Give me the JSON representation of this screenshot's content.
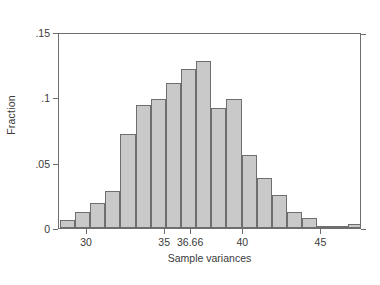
{
  "chart_data": {
    "type": "bar",
    "title": "",
    "subtitle": "",
    "xlabel": "Sample variances",
    "ylabel": "Fraction",
    "xlim": [
      28.2,
      47.6
    ],
    "ylim": [
      0,
      0.15
    ],
    "grid": false,
    "legend": null,
    "xticks": [
      30,
      35,
      36.66,
      40,
      45
    ],
    "xtick_labels": [
      "30",
      "35",
      "36.66",
      "40",
      "45"
    ],
    "yticks": [
      0,
      0.05,
      0.1,
      0.15
    ],
    "ytick_labels": [
      "0",
      ".05",
      ".1",
      ".15"
    ],
    "bin_width": 0.97,
    "bin_starts": [
      28.25,
      29.22,
      30.19,
      31.16,
      32.13,
      33.1,
      34.07,
      35.04,
      36.01,
      36.98,
      37.95,
      38.92,
      39.89,
      40.86,
      41.83,
      42.8,
      43.77,
      44.74,
      45.71,
      46.68
    ],
    "categories": [
      "28.7",
      "29.7",
      "30.7",
      "31.6",
      "32.6",
      "33.6",
      "34.6",
      "35.5",
      "36.5",
      "37.5",
      "38.4",
      "39.4",
      "40.4",
      "41.3",
      "42.3",
      "43.3",
      "44.2",
      "45.2",
      "46.2",
      "47.2"
    ],
    "values": [
      0.006,
      0.012,
      0.019,
      0.028,
      0.072,
      0.094,
      0.099,
      0.111,
      0.122,
      0.128,
      0.092,
      0.099,
      0.056,
      0.038,
      0.025,
      0.012,
      0.008,
      0.001,
      0.0,
      0.003
    ],
    "bar_fill_color": "#c9c9c9",
    "bar_edge_color": "#6e6e6e",
    "axis_color": "#6e6e6e",
    "text_color": "#3a3a3a",
    "background_color": "#ffffff"
  }
}
